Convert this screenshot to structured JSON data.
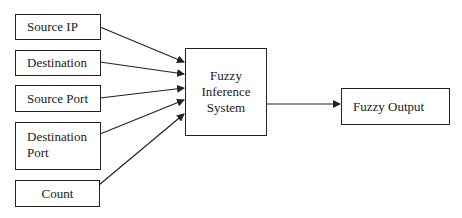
{
  "diagram": {
    "inputs": [
      {
        "id": "source-ip",
        "label": "Source IP"
      },
      {
        "id": "destination",
        "label": "Destination"
      },
      {
        "id": "source-port",
        "label": "Source Port"
      },
      {
        "id": "destination-port",
        "label_line1": "Destination",
        "label_line2": "Port"
      },
      {
        "id": "count",
        "label": "Count"
      }
    ],
    "processor": {
      "line1": "Fuzzy",
      "line2": "Inference",
      "line3": "System"
    },
    "output": {
      "label": "Fuzzy Output"
    },
    "edges": [
      {
        "from": "Source IP",
        "to": "Fuzzy Inference System"
      },
      {
        "from": "Destination",
        "to": "Fuzzy Inference System"
      },
      {
        "from": "Source Port",
        "to": "Fuzzy Inference System"
      },
      {
        "from": "Destination Port",
        "to": "Fuzzy Inference System"
      },
      {
        "from": "Count",
        "to": "Fuzzy Inference System"
      },
      {
        "from": "Fuzzy Inference System",
        "to": "Fuzzy Output"
      }
    ],
    "colors": {
      "stroke": "#222222",
      "background": "#ffffff",
      "text": "#1a1a1a"
    }
  }
}
